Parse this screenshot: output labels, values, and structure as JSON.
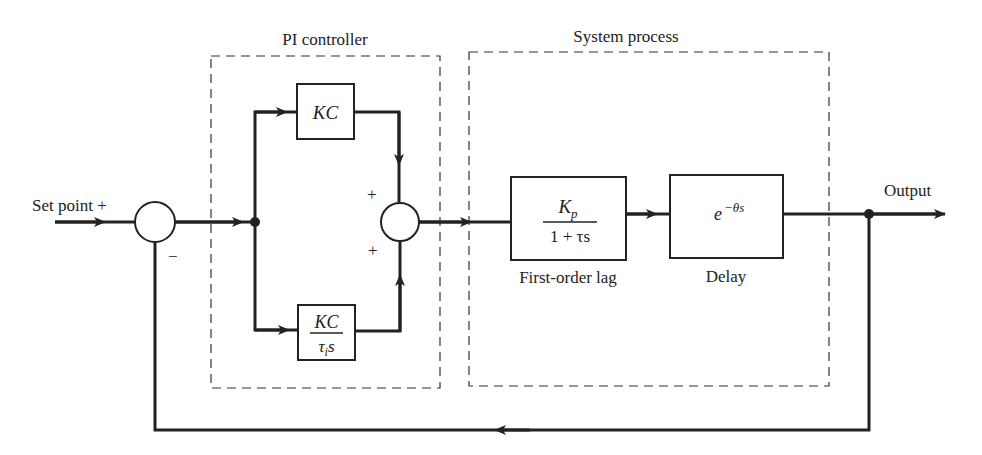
{
  "diagram": {
    "groups": {
      "pi_controller": {
        "label": "PI controller"
      },
      "system_process": {
        "label": "System process"
      }
    },
    "inputs": {
      "set_point": {
        "label": "Set point",
        "sign": "+"
      }
    },
    "outputs": {
      "output": {
        "label": "Output"
      }
    },
    "summing_junctions": {
      "error_sum": {
        "sign_input": "+",
        "sign_feedback": "−"
      },
      "pi_sum": {
        "sign_top": "+",
        "sign_bottom": "+"
      }
    },
    "blocks": {
      "proportional": {
        "text": "KC"
      },
      "integral": {
        "numerator": "KC",
        "denominator_tau": "τ",
        "denominator_sub": "i",
        "denominator_s": "s"
      },
      "first_order_lag": {
        "numerator_k": "K",
        "numerator_sub": "p",
        "denominator": "1 + τs",
        "caption": "First-order lag"
      },
      "delay": {
        "base": "e",
        "exponent": "−θs",
        "caption": "Delay"
      }
    }
  }
}
